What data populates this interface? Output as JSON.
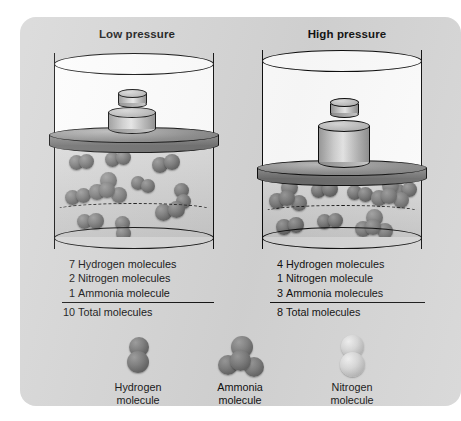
{
  "figure": {
    "background_color": "#d5d5d5",
    "panels": [
      {
        "id": "low",
        "title": "Low pressure",
        "counts": [
          {
            "num": "7",
            "label": "Hydrogen molecules"
          },
          {
            "num": "2",
            "label": "Nitrogen molecules"
          },
          {
            "num": "1",
            "label": "Ammonia molecule"
          }
        ],
        "total": {
          "num": "10",
          "label": "Total molecules"
        }
      },
      {
        "id": "high",
        "title": "High pressure",
        "counts": [
          {
            "num": "4",
            "label": "Hydrogen molecules"
          },
          {
            "num": "1",
            "label": "Nitrogen molecule"
          },
          {
            "num": "3",
            "label": "Ammonia molecules"
          }
        ],
        "total": {
          "num": "8",
          "label": "Total molecules"
        }
      }
    ],
    "legend": [
      {
        "name": "hydrogen",
        "line1": "Hydrogen",
        "line2": "molecule",
        "color": "#6e6e6e"
      },
      {
        "name": "ammonia",
        "line1": "Ammonia",
        "line2": "molecule",
        "color": "#7c7c7c"
      },
      {
        "name": "nitrogen",
        "line1": "Nitrogen",
        "line2": "molecule",
        "color": "#cfcfcf"
      }
    ]
  }
}
